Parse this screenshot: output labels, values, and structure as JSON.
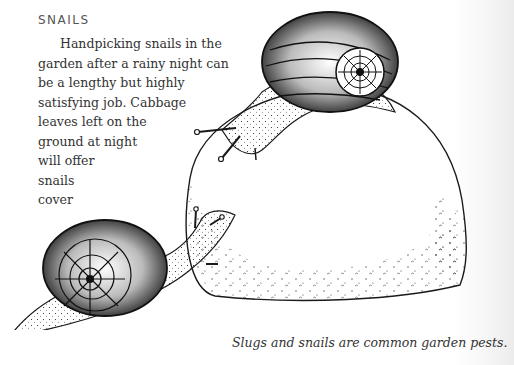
{
  "section": {
    "heading": "SNAILS",
    "paragraph_lines": [
      "Handpicking snails in the",
      "garden after a rainy night can",
      "be a lengthy but highly",
      "satisfying job. Cabbage",
      "leaves left on the",
      "ground at night",
      "will offer",
      "snails",
      "cover"
    ]
  },
  "illustration": {
    "subject": "two-snails-on-rock",
    "ink_color": "#1a1a1a"
  },
  "caption": "Slugs and snails are common garden pests."
}
